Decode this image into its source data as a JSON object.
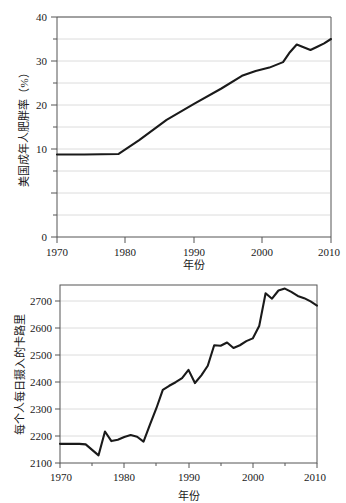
{
  "page": {
    "background_color": "#ffffff",
    "line_color": "#1a1a1a",
    "grid_color": "#dcdcdc",
    "axis_color": "#555555",
    "text_color": "#1a1a1a"
  },
  "figures": [
    {
      "id": "obesity",
      "y_axis_title": "美国成年人肥胖率（%）",
      "x_axis_title": "年份"
    },
    {
      "id": "calories",
      "y_axis_title": "每个人每日摄入的卡路里",
      "x_axis_title": "年份"
    }
  ],
  "chart_data": [
    {
      "type": "line",
      "title": "",
      "xlabel": "年份",
      "ylabel": "美国成年人肥胖率（%）",
      "xlim": [
        1970,
        2010
      ],
      "ylim": [
        0,
        40
      ],
      "xticks": [
        1970,
        1980,
        1990,
        2000,
        2010
      ],
      "xtick_labels": [
        "1970",
        "1980",
        "1990",
        "2000",
        "2010"
      ],
      "yticks": [
        0,
        10,
        20,
        30,
        40
      ],
      "ytick_labels": [
        "0",
        "10",
        "20",
        "30",
        "40"
      ],
      "yticks_minor": [
        5,
        15,
        25,
        35
      ],
      "grid": "horizontal",
      "legend": "none",
      "series": [
        {
          "name": "美国成年人肥胖率",
          "x": [
            1970,
            1974,
            1979,
            1982,
            1986,
            1990,
            1994,
            1997,
            1999,
            2001,
            2003,
            2004,
            2005,
            2006,
            2007,
            2008,
            2009,
            2010
          ],
          "values": [
            15.0,
            15.0,
            15.1,
            17.6,
            21.3,
            24.2,
            27.0,
            29.3,
            30.2,
            30.8,
            31.8,
            33.6,
            35.0,
            34.5,
            34.0,
            34.6,
            35.2,
            36.0
          ]
        }
      ]
    },
    {
      "type": "line",
      "title": "",
      "xlabel": "年份",
      "ylabel": "每个人每日摄入的卡路里",
      "xlim": [
        1970,
        2010
      ],
      "ylim": [
        2100,
        2750
      ],
      "xticks": [
        1970,
        1980,
        1990,
        2000,
        2010
      ],
      "xtick_labels": [
        "1970",
        "1980",
        "1990",
        "2000",
        "2010"
      ],
      "yticks": [
        2100,
        2200,
        2300,
        2400,
        2500,
        2600,
        2700
      ],
      "ytick_labels": [
        "2100",
        "2200",
        "2300",
        "2400",
        "2500",
        "2600",
        "2700"
      ],
      "xticks_minor": [
        1975,
        1985,
        1995,
        2005
      ],
      "grid": "horizontal",
      "legend": "none",
      "series": [
        {
          "name": "每个人每日摄入的卡路里",
          "x": [
            1970,
            1971,
            1972,
            1973,
            1974,
            1975,
            1976,
            1977,
            1978,
            1979,
            1980,
            1981,
            1982,
            1983,
            1984,
            1985,
            1986,
            1987,
            1988,
            1989,
            1990,
            1991,
            1992,
            1993,
            1994,
            1995,
            1996,
            1997,
            1998,
            1999,
            2000,
            2001,
            2002,
            2003,
            2004,
            2005,
            2006,
            2007,
            2008,
            2009,
            2010
          ],
          "values": [
            2170,
            2170,
            2170,
            2170,
            2168,
            2148,
            2128,
            2215,
            2180,
            2185,
            2195,
            2202,
            2196,
            2178,
            2240,
            2300,
            2367,
            2382,
            2395,
            2410,
            2440,
            2392,
            2420,
            2455,
            2530,
            2528,
            2540,
            2520,
            2530,
            2545,
            2555,
            2600,
            2720,
            2700,
            2730,
            2737,
            2725,
            2710,
            2702,
            2690,
            2675
          ]
        }
      ]
    }
  ]
}
